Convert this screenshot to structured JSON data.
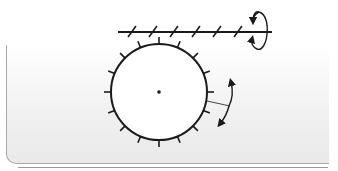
{
  "diagram": {
    "title": "",
    "type": "worm-gear",
    "components": [
      {
        "id": "worm-shaft",
        "label": "",
        "description": "horizontal threaded worm shaft with slanted thread marks"
      },
      {
        "id": "worm-rotation-arrow",
        "label": "",
        "description": "circular rotation arrow around right end of worm shaft"
      },
      {
        "id": "worm-wheel",
        "label": "",
        "description": "gear wheel with radial teeth and center pivot"
      },
      {
        "id": "wheel-rotation-arrow",
        "label": "",
        "description": "double-headed arc arrow indicating wheel rotation"
      }
    ],
    "colors": {
      "stroke": "#1a1a1a",
      "panel_border": "#a9a9a9",
      "wheel_fill": "#ffffff"
    },
    "wheel": {
      "cx": 159,
      "cy": 92,
      "r": 48,
      "tooth_count": 16
    },
    "worm": {
      "x1": 118,
      "x2": 272,
      "y": 32,
      "thread_count": 6
    }
  }
}
